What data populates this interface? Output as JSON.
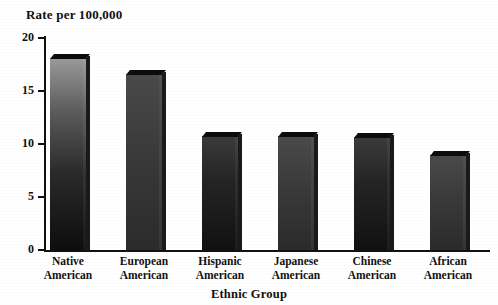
{
  "chart_data": {
    "type": "bar",
    "title": "",
    "ylabel": "Rate per 100,000",
    "xlabel": "Ethnic Group",
    "categories": [
      "Native American",
      "European American",
      "Hispanic American",
      "Japanese American",
      "Chinese American",
      "African American"
    ],
    "category_lines": [
      [
        "Native",
        "American"
      ],
      [
        "European",
        "American"
      ],
      [
        "Hispanic",
        "American"
      ],
      [
        "Japanese",
        "American"
      ],
      [
        "Chinese",
        "American"
      ],
      [
        "African",
        "American"
      ]
    ],
    "values": [
      18.1,
      16.6,
      10.8,
      10.8,
      10.7,
      9.0
    ],
    "ylim": [
      0,
      20
    ],
    "yticks": [
      0,
      5,
      10,
      15,
      20
    ],
    "ytick_labels": [
      "0",
      "5",
      "10",
      "15",
      "20"
    ],
    "grid": false,
    "legend": null,
    "bar_color": "#1a1a1a"
  },
  "axis": {
    "y_caption": "Rate per 100,000",
    "x_caption": "Ethnic Group"
  }
}
